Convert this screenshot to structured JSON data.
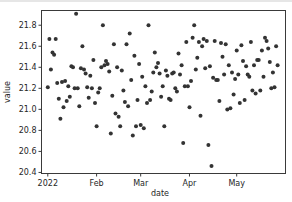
{
  "chart_data": {
    "type": "scatter",
    "title": "",
    "xlabel": "date",
    "ylabel": "value",
    "x_tick_labels": [
      "2022",
      "Feb",
      "Mar",
      "Apr",
      "May"
    ],
    "x_tick_days": [
      0,
      31,
      59,
      90,
      120
    ],
    "y_tick_labels": [
      "20.4",
      "20.6",
      "20.8",
      "21.0",
      "21.2",
      "21.4",
      "21.6",
      "21.8"
    ],
    "y_ticks": [
      20.4,
      20.6,
      20.8,
      21.0,
      21.2,
      21.4,
      21.6,
      21.8
    ],
    "ylim": [
      20.39,
      21.94
    ],
    "xlim_days": [
      -4,
      151
    ],
    "grid": false,
    "legend": null,
    "marker_color": "#333333",
    "x_start_date": "2022-01-01",
    "points": [
      [
        0,
        21.21
      ],
      [
        1,
        21.67
      ],
      [
        2,
        21.38
      ],
      [
        3,
        21.54
      ],
      [
        4,
        21.52
      ],
      [
        5,
        21.67
      ],
      [
        6,
        21.25
      ],
      [
        7,
        21.1
      ],
      [
        8,
        20.91
      ],
      [
        9,
        21.26
      ],
      [
        10,
        21.02
      ],
      [
        11,
        21.27
      ],
      [
        12,
        21.08
      ],
      [
        13,
        21.22
      ],
      [
        14,
        21.12
      ],
      [
        15,
        21.41
      ],
      [
        16,
        21.4
      ],
      [
        17,
        21.2
      ],
      [
        18,
        21.91
      ],
      [
        19,
        21.2
      ],
      [
        20,
        21.03
      ],
      [
        21,
        21.39
      ],
      [
        22,
        21.6
      ],
      [
        23,
        21.38
      ],
      [
        24,
        21.34
      ],
      [
        25,
        21.21
      ],
      [
        26,
        21.11
      ],
      [
        27,
        21.32
      ],
      [
        28,
        21.2
      ],
      [
        29,
        21.47
      ],
      [
        30,
        21.06
      ],
      [
        31,
        20.84
      ],
      [
        32,
        21.16
      ],
      [
        33,
        21.2
      ],
      [
        34,
        21.4
      ],
      [
        35,
        21.8
      ],
      [
        36,
        21.42
      ],
      [
        37,
        21.46
      ],
      [
        38,
        21.43
      ],
      [
        39,
        21.36
      ],
      [
        40,
        20.77
      ],
      [
        41,
        21.13
      ],
      [
        42,
        21.62
      ],
      [
        43,
        20.96
      ],
      [
        44,
        21.4
      ],
      [
        45,
        20.93
      ],
      [
        46,
        20.84
      ],
      [
        47,
        21.37
      ],
      [
        48,
        21.18
      ],
      [
        49,
        21.07
      ],
      [
        50,
        21.62
      ],
      [
        51,
        21.03
      ],
      [
        52,
        21.72
      ],
      [
        53,
        21.28
      ],
      [
        54,
        20.75
      ],
      [
        55,
        21.51
      ],
      [
        56,
        20.84
      ],
      [
        57,
        21.09
      ],
      [
        58,
        21.43
      ],
      [
        59,
        20.85
      ],
      [
        60,
        21.31
      ],
      [
        61,
        20.82
      ],
      [
        62,
        21.22
      ],
      [
        63,
        21.06
      ],
      [
        64,
        21.8
      ],
      [
        65,
        21.09
      ],
      [
        66,
        21.17
      ],
      [
        67,
        21.35
      ],
      [
        68,
        21.54
      ],
      [
        69,
        21.4
      ],
      [
        70,
        21.44
      ],
      [
        71,
        21.34
      ],
      [
        72,
        21.12
      ],
      [
        73,
        21.22
      ],
      [
        74,
        20.84
      ],
      [
        75,
        21.37
      ],
      [
        76,
        21.32
      ],
      [
        77,
        21.1
      ],
      [
        78,
        21.09
      ],
      [
        79,
        21.34
      ],
      [
        80,
        21.35
      ],
      [
        81,
        21.2
      ],
      [
        82,
        21.17
      ],
      [
        83,
        21.53
      ],
      [
        84,
        21.33
      ],
      [
        85,
        21.42
      ],
      [
        86,
        20.68
      ],
      [
        87,
        21.22
      ],
      [
        88,
        21.64
      ],
      [
        89,
        21.22
      ],
      [
        90,
        21.02
      ],
      [
        91,
        21.27
      ],
      [
        92,
        21.68
      ],
      [
        93,
        21.8
      ],
      [
        94,
        21.38
      ],
      [
        95,
        21.49
      ],
      [
        96,
        21.64
      ],
      [
        97,
        20.94
      ],
      [
        98,
        21.6
      ],
      [
        99,
        21.67
      ],
      [
        100,
        21.39
      ],
      [
        101,
        21.65
      ],
      [
        102,
        20.66
      ],
      [
        103,
        21.41
      ],
      [
        104,
        20.46
      ],
      [
        105,
        21.3
      ],
      [
        106,
        21.65
      ],
      [
        107,
        21.28
      ],
      [
        108,
        21.28
      ],
      [
        109,
        21.08
      ],
      [
        110,
        21.63
      ],
      [
        111,
        21.5
      ],
      [
        112,
        21.33
      ],
      [
        113,
        21.62
      ],
      [
        114,
        21.0
      ],
      [
        115,
        21.42
      ],
      [
        116,
        21.01
      ],
      [
        117,
        21.35
      ],
      [
        118,
        21.14
      ],
      [
        119,
        21.29
      ],
      [
        120,
        21.56
      ],
      [
        121,
        21.33
      ],
      [
        122,
        21.06
      ],
      [
        123,
        21.61
      ],
      [
        124,
        21.46
      ],
      [
        125,
        21.09
      ],
      [
        126,
        21.41
      ],
      [
        127,
        21.33
      ],
      [
        128,
        21.31
      ],
      [
        129,
        21.64
      ],
      [
        130,
        21.18
      ],
      [
        131,
        21.42
      ],
      [
        132,
        21.15
      ],
      [
        133,
        21.47
      ],
      [
        134,
        21.47
      ],
      [
        135,
        21.18
      ],
      [
        136,
        21.56
      ],
      [
        137,
        21.31
      ],
      [
        138,
        21.68
      ],
      [
        139,
        21.65
      ],
      [
        140,
        21.58
      ],
      [
        141,
        21.45
      ],
      [
        142,
        21.2
      ],
      [
        143,
        21.35
      ],
      [
        144,
        21.21
      ],
      [
        145,
        21.6
      ],
      [
        146,
        21.42
      ]
    ]
  }
}
